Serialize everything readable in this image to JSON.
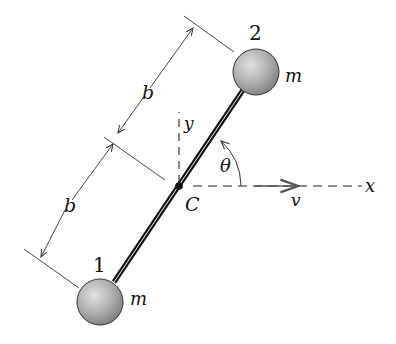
{
  "diagram": {
    "type": "rigid dumbbell rod with two masses",
    "labels": {
      "mass_2_number": "2",
      "mass_2_label": "m",
      "mass_1_number": "1",
      "mass_1_label": "m",
      "upper_half_length": "b",
      "lower_half_length": "b",
      "center_label": "C",
      "y_axis": "y",
      "x_axis": "x",
      "angle": "θ",
      "velocity": "v"
    },
    "colors": {
      "line": "#111111",
      "mass_fill": "#b5b5b5",
      "background": "#ffffff"
    }
  }
}
